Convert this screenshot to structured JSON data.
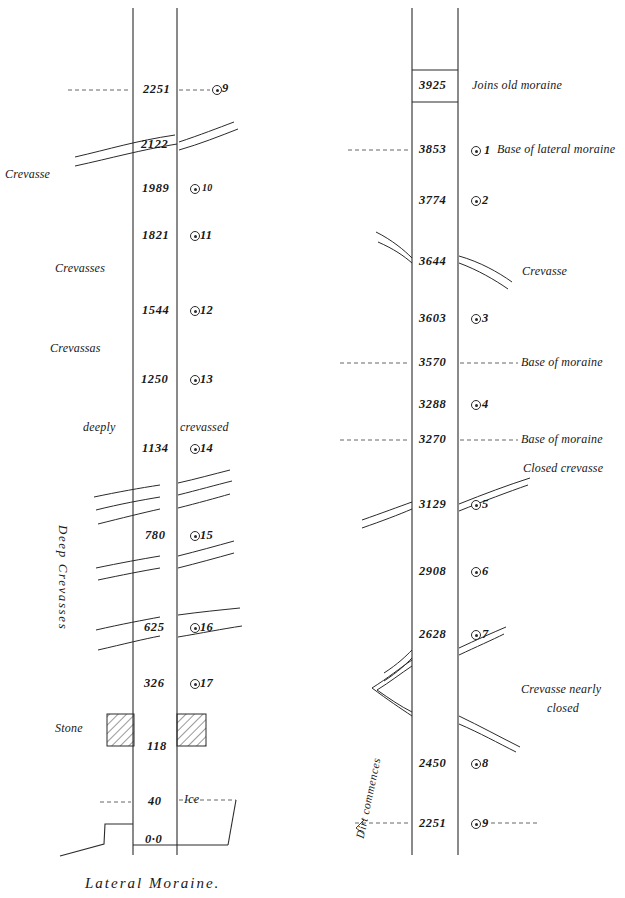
{
  "figure": {
    "title": "Lateral Moraine.",
    "kind": "glacier-longitudinal-section",
    "caption": "Lateral Moraine."
  },
  "colors": {
    "ink": "#1c1c1c",
    "line": "#2a2a2a",
    "paper": "#ffffff",
    "hatch": "#333333",
    "dashed": "#555555"
  },
  "left_column": {
    "name": "lower-section",
    "depths": [
      {
        "value": "2251",
        "y": 90,
        "marker": "9",
        "dashed": true
      },
      {
        "value": "2122",
        "y": 145,
        "marker": "",
        "dashed": false
      },
      {
        "value": "1989",
        "y": 189,
        "marker": "10",
        "dashed": false
      },
      {
        "value": "1821",
        "y": 236,
        "marker": "11",
        "dashed": false
      },
      {
        "value": "1544",
        "y": 311,
        "marker": "12",
        "dashed": false
      },
      {
        "value": "1250",
        "y": 380,
        "marker": "13",
        "dashed": false
      },
      {
        "value": "1134",
        "y": 449,
        "marker": "14",
        "dashed": false
      },
      {
        "value": "780",
        "y": 536,
        "marker": "15",
        "dashed": false
      },
      {
        "value": "625",
        "y": 628,
        "marker": "16",
        "dashed": false
      },
      {
        "value": "326",
        "y": 684,
        "marker": "17",
        "dashed": false
      },
      {
        "value": "118",
        "y": 746,
        "marker": "",
        "dashed": false
      },
      {
        "value": "40",
        "y": 802,
        "marker": "",
        "dashed": true
      },
      {
        "value": "0·0",
        "y": 840,
        "marker": "",
        "dashed": false
      }
    ],
    "notes": [
      {
        "text": "Crevasse",
        "x": 5,
        "y": 168,
        "style": "note"
      },
      {
        "text": "Crevasses",
        "x": 55,
        "y": 262,
        "style": "note"
      },
      {
        "text": "Crevassas",
        "x": 50,
        "y": 342,
        "style": "note"
      },
      {
        "text": "deeply",
        "x": 83,
        "y": 423,
        "style": "note"
      },
      {
        "text": "crevassed",
        "x": 180,
        "y": 423,
        "style": "note"
      },
      {
        "text": "Stone",
        "x": 55,
        "y": 723,
        "style": "note"
      },
      {
        "text": "Ice",
        "x": 184,
        "y": 795,
        "style": "note"
      }
    ],
    "vertical_note": {
      "text": "Deep  Crevasses",
      "x": 60,
      "y": 525
    }
  },
  "right_column": {
    "name": "upper-section",
    "depths": [
      {
        "value": "3925",
        "y": 85,
        "marker": "",
        "note": "Joins old moraine",
        "dashed": false
      },
      {
        "value": "3853",
        "y": 150,
        "marker": "1",
        "note": "Base of lateral moraine",
        "dashed": true
      },
      {
        "value": "3774",
        "y": 200,
        "marker": "2",
        "note": "",
        "dashed": false
      },
      {
        "value": "3644",
        "y": 261,
        "marker": "",
        "note": "Crevasse",
        "dashed": false
      },
      {
        "value": "3603",
        "y": 318,
        "marker": "3",
        "note": "",
        "dashed": false
      },
      {
        "value": "3570",
        "y": 363,
        "marker": "",
        "note": "Base of moraine",
        "dashed": true
      },
      {
        "value": "3288",
        "y": 404,
        "marker": "4",
        "note": "",
        "dashed": false
      },
      {
        "value": "3270",
        "y": 440,
        "marker": "",
        "note": "Base of moraine",
        "dashed": true
      },
      {
        "value": "3129",
        "y": 505,
        "marker": "5",
        "note": "",
        "dashed": false
      },
      {
        "value": "2908",
        "y": 572,
        "marker": "6",
        "note": "",
        "dashed": false
      },
      {
        "value": "2628",
        "y": 634,
        "marker": "7",
        "note": "",
        "dashed": false
      },
      {
        "value": "2450",
        "y": 763,
        "marker": "8",
        "note": "",
        "dashed": false
      },
      {
        "value": "2251",
        "y": 823,
        "marker": "9",
        "note": "",
        "dashed": true
      }
    ],
    "side_notes": [
      {
        "text": "Joins old moraine",
        "x": 472,
        "y": 85,
        "style": "note"
      },
      {
        "text": "Base of lateral moraine",
        "x": 497,
        "y": 150,
        "style": "note"
      },
      {
        "text": "Crevasse",
        "x": 522,
        "y": 272,
        "style": "note"
      },
      {
        "text": "Base of moraine",
        "x": 521,
        "y": 363,
        "style": "note"
      },
      {
        "text": "Base of moraine",
        "x": 521,
        "y": 440,
        "style": "note"
      },
      {
        "text": "Closed crevasse",
        "x": 523,
        "y": 470,
        "style": "note"
      },
      {
        "text": "Crevasse nearly",
        "x": 521,
        "y": 690,
        "style": "note"
      },
      {
        "text": "closed",
        "x": 547,
        "y": 709,
        "style": "note"
      }
    ],
    "vertical_note": {
      "text": "Dirt commences",
      "x": 360,
      "y": 828
    }
  },
  "bands": {
    "left": {
      "x_left": 133,
      "x_right": 177,
      "top": 8,
      "bottom": 855
    },
    "right": {
      "x_left": 412,
      "x_right": 458,
      "top": 8,
      "bottom": 855
    }
  },
  "stones": [
    {
      "name": "stone-block-left",
      "x": 107,
      "y": 714,
      "w": 27,
      "h": 32
    },
    {
      "name": "stone-block-right",
      "x": 177,
      "y": 714,
      "w": 29,
      "h": 32
    }
  ],
  "rules": {
    "moraine_join_top": 70,
    "moraine_join_bottom": 102
  }
}
